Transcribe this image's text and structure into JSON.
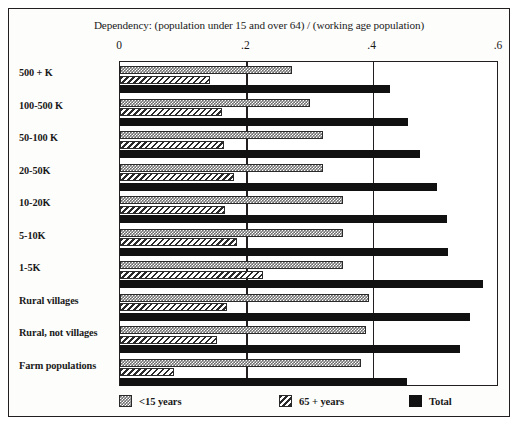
{
  "chart_data": {
    "type": "bar",
    "orientation": "horizontal",
    "title": "Dependency: (population under 15 and over 64) / (working age population)",
    "xlabel": "",
    "ylabel": "",
    "xlim": [
      0,
      0.6
    ],
    "grid": true,
    "gridlines": [
      0.2,
      0.4
    ],
    "legend_position": "bottom",
    "tick_labels": [
      "0",
      ".2",
      ".4",
      ".6"
    ],
    "ticks": [
      0,
      0.2,
      0.4,
      0.6
    ],
    "categories": [
      "500 + K",
      "100-500 K",
      "50-100 K",
      "20-50K",
      "10-20K",
      "5-10K",
      "1-5K",
      "Rural villages",
      "Rural, not villages",
      "Farm populations"
    ],
    "series": [
      {
        "name": "<15 years",
        "pattern": "checkered-gray",
        "color": "#6f6f6f",
        "values": [
          0.272,
          0.3,
          0.322,
          0.322,
          0.353,
          0.353,
          0.353,
          0.394,
          0.389,
          0.381
        ]
      },
      {
        "name": "65 + years",
        "pattern": "diagonal-hatch",
        "color": "#ffffff",
        "values": [
          0.142,
          0.161,
          0.164,
          0.18,
          0.167,
          0.186,
          0.227,
          0.169,
          0.153,
          0.085
        ]
      },
      {
        "name": "Total",
        "pattern": "solid-black",
        "color": "#111111",
        "values": [
          0.428,
          0.456,
          0.475,
          0.502,
          0.518,
          0.519,
          0.575,
          0.554,
          0.538,
          0.455
        ]
      }
    ]
  },
  "legend": {
    "items": [
      {
        "label": "<15 years",
        "style": "under15"
      },
      {
        "label": "65 + years",
        "style": "over65"
      },
      {
        "label": "Total",
        "style": "total"
      }
    ]
  }
}
